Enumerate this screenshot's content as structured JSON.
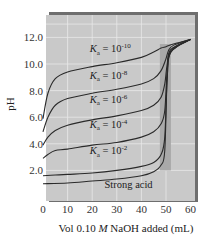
{
  "chart_data": {
    "type": "line",
    "title": "",
    "xlabel": "Vol 0.10 M NaOH added (mL)",
    "xlabel_parts": {
      "pre": "Vol 0.10 ",
      "italic": "M",
      "post": " NaOH added (mL)"
    },
    "ylabel": "pH",
    "xlim": [
      0,
      60
    ],
    "ylim": [
      0,
      14
    ],
    "x_ticks": [
      "0",
      "10",
      "20",
      "30",
      "40",
      "50",
      "60"
    ],
    "y_ticks": [
      "2.0",
      "4.0",
      "6.0",
      "8.0",
      "10.0",
      "12.0"
    ],
    "grid": true,
    "equivalence_band": {
      "x_from": 47.5,
      "x_to": 52,
      "y_from": 2.0,
      "y_to": 11.5
    },
    "colors": {
      "plot_bg": "#c9c9c9",
      "grid": "#e8e8e8",
      "band": "#a9a9a9",
      "frame_shadow": "#6e6e6e",
      "curve": "#2a2a2a"
    },
    "series": [
      {
        "name": "Ka = 10^-10",
        "label_base": "K",
        "label_sub": "a",
        "label_mid": " = 10",
        "label_exp": "-10",
        "points": [
          [
            0,
            5.9
          ],
          [
            2,
            7.8
          ],
          [
            5,
            8.9
          ],
          [
            10,
            9.4
          ],
          [
            20,
            9.8
          ],
          [
            30,
            10.1
          ],
          [
            40,
            10.5
          ],
          [
            45,
            10.9
          ],
          [
            48,
            11.2
          ],
          [
            50,
            11.3
          ],
          [
            52,
            11.45
          ],
          [
            55,
            11.6
          ],
          [
            60,
            11.85
          ]
        ]
      },
      {
        "name": "Ka = 10^-8",
        "label_base": "K",
        "label_sub": "a",
        "label_mid": " = 10",
        "label_exp": "-8",
        "points": [
          [
            0,
            4.9
          ],
          [
            2,
            6.0
          ],
          [
            5,
            6.9
          ],
          [
            10,
            7.4
          ],
          [
            20,
            7.8
          ],
          [
            30,
            8.1
          ],
          [
            40,
            8.5
          ],
          [
            45,
            8.9
          ],
          [
            48,
            9.5
          ],
          [
            50,
            10.4
          ],
          [
            51,
            11.0
          ],
          [
            53,
            11.4
          ],
          [
            60,
            11.85
          ]
        ]
      },
      {
        "name": "Ka = 10^-6",
        "label_base": "K",
        "label_sub": "a",
        "label_mid": " = 10",
        "label_exp": "-6",
        "points": [
          [
            0,
            3.9
          ],
          [
            2,
            4.5
          ],
          [
            5,
            5.0
          ],
          [
            10,
            5.4
          ],
          [
            20,
            5.8
          ],
          [
            30,
            6.1
          ],
          [
            40,
            6.5
          ],
          [
            45,
            6.9
          ],
          [
            48,
            7.5
          ],
          [
            49.5,
            8.5
          ],
          [
            50.5,
            10.0
          ],
          [
            52,
            11.1
          ],
          [
            60,
            11.85
          ]
        ]
      },
      {
        "name": "Ka = 10^-4",
        "label_base": "K",
        "label_sub": "a",
        "label_mid": " = 10",
        "label_exp": "-4",
        "points": [
          [
            0,
            2.9
          ],
          [
            2,
            3.2
          ],
          [
            5,
            3.5
          ],
          [
            10,
            3.6
          ],
          [
            20,
            3.9
          ],
          [
            30,
            4.1
          ],
          [
            40,
            4.5
          ],
          [
            45,
            4.9
          ],
          [
            48,
            5.5
          ],
          [
            49.5,
            6.5
          ],
          [
            50.5,
            9.5
          ],
          [
            52,
            11.0
          ],
          [
            60,
            11.85
          ]
        ]
      },
      {
        "name": "Ka = 10^-2",
        "label_base": "K",
        "label_sub": "a",
        "label_mid": " = 10",
        "label_exp": "-2",
        "points": [
          [
            0,
            1.6
          ],
          [
            5,
            1.65
          ],
          [
            10,
            1.7
          ],
          [
            20,
            1.8
          ],
          [
            30,
            2.0
          ],
          [
            40,
            2.3
          ],
          [
            45,
            2.6
          ],
          [
            48,
            3.2
          ],
          [
            49.5,
            4.5
          ],
          [
            50.5,
            9.0
          ],
          [
            52,
            10.9
          ],
          [
            60,
            11.85
          ]
        ]
      },
      {
        "name": "Strong acid",
        "label_text": "Strong acid",
        "points": [
          [
            0,
            1.0
          ],
          [
            10,
            1.05
          ],
          [
            20,
            1.2
          ],
          [
            30,
            1.35
          ],
          [
            40,
            1.6
          ],
          [
            45,
            1.9
          ],
          [
            48,
            2.4
          ],
          [
            49.5,
            3.5
          ],
          [
            50.5,
            9.0
          ],
          [
            52,
            10.9
          ],
          [
            60,
            11.85
          ]
        ]
      }
    ],
    "label_positions": [
      {
        "x": 19,
        "y": 10.9
      },
      {
        "x": 19,
        "y": 8.9
      },
      {
        "x": 19,
        "y": 7.1
      },
      {
        "x": 19,
        "y": 5.2
      },
      {
        "x": 19,
        "y": 3.2
      },
      {
        "x": 25,
        "y": 0.7
      }
    ]
  }
}
